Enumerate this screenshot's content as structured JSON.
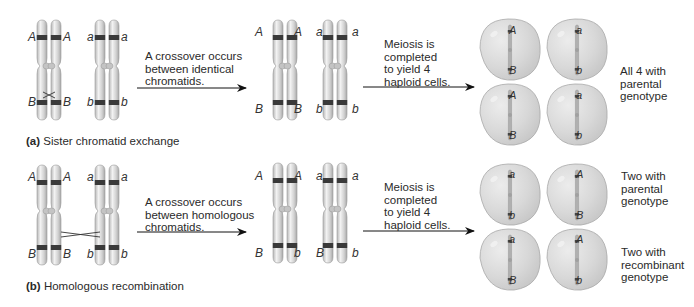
{
  "figure": {
    "colors": {
      "chromatid_fill": "#d9d9d9",
      "chromatid_highlight": "#f4f4f4",
      "chromatid_edge": "#9a9a9a",
      "band": "#3a3a3a",
      "cell_fill": "#d6d6d6",
      "cell_edge": "#a8a8a8",
      "arrow": "#111111"
    },
    "panels": [
      {
        "id": "a",
        "caption_label": "(a)",
        "caption_text": "Sister chromatid exchange",
        "step1_text": [
          "A crossover occurs",
          "between identical",
          "chromatids."
        ],
        "step2_text": [
          "Meiosis is",
          "completed",
          "to yield 4",
          "haploid cells."
        ],
        "before": {
          "pair1": {
            "top": [
              "A",
              "A"
            ],
            "bottom": [
              "B",
              "B"
            ]
          },
          "pair2": {
            "top": [
              "a",
              "a"
            ],
            "bottom": [
              "b",
              "b"
            ]
          }
        },
        "after": {
          "pair1": {
            "top": [
              "A",
              "A"
            ],
            "bottom": [
              "B",
              "B"
            ]
          },
          "pair2": {
            "top": [
              "a",
              "a"
            ],
            "bottom": [
              "b",
              "b"
            ]
          }
        },
        "cells": [
          {
            "top": "A",
            "bottom": "B"
          },
          {
            "top": "a",
            "bottom": "b"
          },
          {
            "top": "A",
            "bottom": "B"
          },
          {
            "top": "a",
            "bottom": "b"
          }
        ],
        "results": [
          {
            "lines": [
              "All 4 with",
              "parental",
              "genotype"
            ]
          }
        ]
      },
      {
        "id": "b",
        "caption_label": "(b)",
        "caption_text": "Homologous recombination",
        "step1_text": [
          "A crossover occurs",
          "between homologous",
          "chromatids."
        ],
        "step2_text": [
          "Meiosis is",
          "completed",
          "to yield 4",
          "haploid cells."
        ],
        "before": {
          "pair1": {
            "top": [
              "A",
              "A"
            ],
            "bottom": [
              "B",
              "B"
            ]
          },
          "pair2": {
            "top": [
              "a",
              "a"
            ],
            "bottom": [
              "b",
              "b"
            ]
          }
        },
        "after": {
          "pair1": {
            "top": [
              "A",
              "A"
            ],
            "bottom": [
              "B",
              "b"
            ]
          },
          "pair2": {
            "top": [
              "a",
              "a"
            ],
            "bottom": [
              "B",
              "b"
            ]
          }
        },
        "cells": [
          {
            "top": "a",
            "bottom": "b"
          },
          {
            "top": "A",
            "bottom": "B"
          },
          {
            "top": "a",
            "bottom": "B"
          },
          {
            "top": "A",
            "bottom": "b"
          }
        ],
        "results": [
          {
            "lines": [
              "Two with",
              "parental",
              "genotype"
            ]
          },
          {
            "lines": [
              "Two with",
              "recombinant",
              "genotype"
            ]
          }
        ]
      }
    ]
  }
}
